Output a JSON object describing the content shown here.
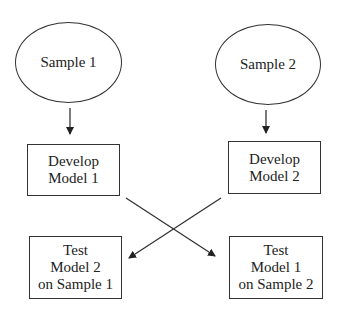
{
  "nodes": {
    "sample1": {
      "label": "Sample 1"
    },
    "sample2": {
      "label": "Sample 2"
    },
    "develop1": {
      "line1": "Develop",
      "line2": "Model 1"
    },
    "develop2": {
      "line1": "Develop",
      "line2": "Model 2"
    },
    "test1": {
      "line1": "Test",
      "line2": "Model 2",
      "line3": "on Sample 1"
    },
    "test2": {
      "line1": "Test",
      "line2": "Model 1",
      "line3": "on Sample 2"
    }
  },
  "edges": [
    {
      "from": "Sample 1",
      "to": "Develop Model 1"
    },
    {
      "from": "Sample 2",
      "to": "Develop Model 2"
    },
    {
      "from": "Develop Model 1",
      "to": "Test Model 1 on Sample 2"
    },
    {
      "from": "Develop Model 2",
      "to": "Test Model 2 on Sample 1"
    }
  ],
  "colors": {
    "stroke": "#333333",
    "text": "#222222",
    "background": "#ffffff"
  }
}
